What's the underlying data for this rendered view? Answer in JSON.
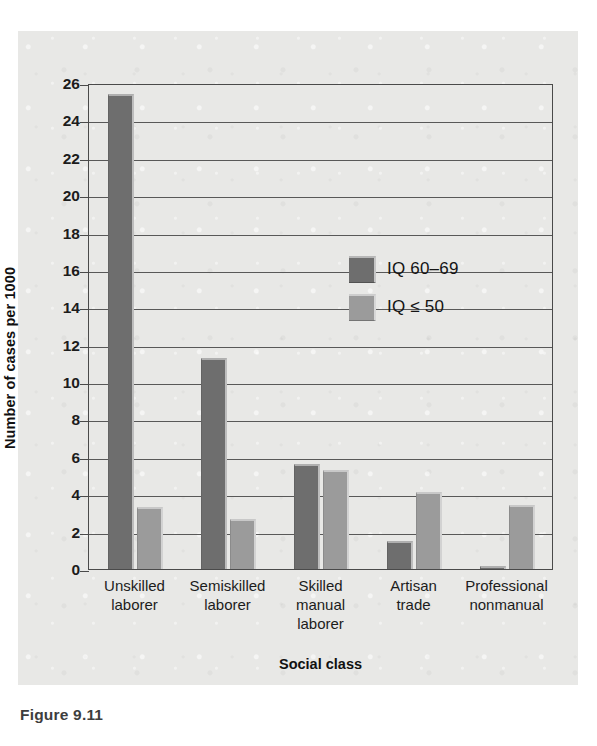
{
  "figure": {
    "caption": "Figure 9.11"
  },
  "chart_data": {
    "type": "bar",
    "title": "",
    "xlabel": "Social class",
    "ylabel": "Number of cases per 1000",
    "categories": [
      "Unskilled\nlaborer",
      "Semiskilled\nlaborer",
      "Skilled\nmanual\nlaborer",
      "Artisan\ntrade",
      "Professional\nnonmanual"
    ],
    "category_lines": [
      [
        "Unskilled",
        "laborer"
      ],
      [
        "Semiskilled",
        "laborer"
      ],
      [
        "Skilled",
        "manual",
        "laborer"
      ],
      [
        "Artisan",
        "trade"
      ],
      [
        "Professional",
        "nonmanual"
      ]
    ],
    "series": [
      {
        "name": "IQ 60–69",
        "color": "#6e6e6e",
        "values": [
          25.4,
          11.3,
          5.6,
          1.5,
          0.15
        ]
      },
      {
        "name": "IQ ≤ 50",
        "color": "#9b9b9b",
        "values": [
          3.3,
          2.7,
          5.3,
          4.1,
          3.4
        ]
      }
    ],
    "ylim": [
      0,
      26
    ],
    "ytick_step": 2,
    "yticks": [
      0,
      2,
      4,
      6,
      8,
      10,
      12,
      14,
      16,
      18,
      20,
      22,
      24,
      26
    ],
    "grid": true,
    "grid_axis": "y",
    "legend_position": "inside-upper-center"
  },
  "colors": {
    "panel_background": "#e8e8e6",
    "axis": "#4a4a4a",
    "gridline": "#585858",
    "text": "#1c1c1c",
    "series_dark": "#6e6e6e",
    "series_light": "#9b9b9b"
  }
}
